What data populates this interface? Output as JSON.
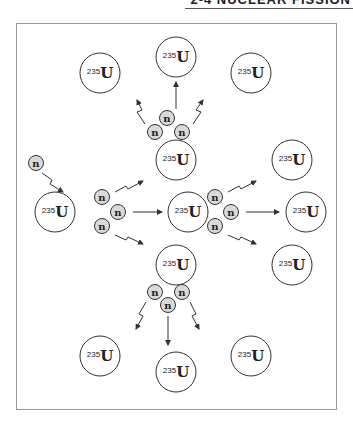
{
  "header": {
    "title": "2-4 NUCLEAR FISSION"
  },
  "diagram": {
    "nucleus_mass_number": "235",
    "nucleus_symbol": "U",
    "neutron_symbol": "n",
    "colors": {
      "stroke": "#333333",
      "neutron_fill": "#d9d9d9",
      "nucleus_fill": "#ffffff"
    },
    "nuclei": [
      {
        "id": "top-left",
        "x": 100,
        "y": 73
      },
      {
        "id": "top-center",
        "x": 176,
        "y": 57
      },
      {
        "id": "top-right",
        "x": 251,
        "y": 73
      },
      {
        "id": "upper-middle",
        "x": 176,
        "y": 160
      },
      {
        "id": "initial",
        "x": 55,
        "y": 212
      },
      {
        "id": "center",
        "x": 188,
        "y": 212
      },
      {
        "id": "right-upper",
        "x": 292,
        "y": 160
      },
      {
        "id": "right-middle",
        "x": 306,
        "y": 212
      },
      {
        "id": "right-lower",
        "x": 292,
        "y": 265
      },
      {
        "id": "lower-middle",
        "x": 176,
        "y": 265
      },
      {
        "id": "bottom-left",
        "x": 100,
        "y": 356
      },
      {
        "id": "bottom-center",
        "x": 176,
        "y": 372
      },
      {
        "id": "bottom-right",
        "x": 251,
        "y": 356
      }
    ],
    "neutrons": [
      {
        "id": "incoming",
        "x": 36,
        "y": 163
      },
      {
        "x": 167,
        "y": 118
      },
      {
        "x": 155,
        "y": 132
      },
      {
        "x": 182,
        "y": 132
      },
      {
        "x": 102,
        "y": 197
      },
      {
        "x": 118,
        "y": 212
      },
      {
        "x": 102,
        "y": 226
      },
      {
        "x": 215,
        "y": 197
      },
      {
        "x": 231,
        "y": 212
      },
      {
        "x": 215,
        "y": 226
      },
      {
        "x": 155,
        "y": 292
      },
      {
        "x": 182,
        "y": 292
      },
      {
        "x": 168,
        "y": 305
      }
    ]
  }
}
